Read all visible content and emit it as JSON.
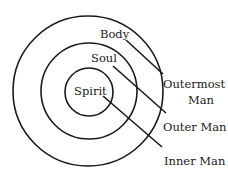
{
  "diagram": {
    "type": "concentric-circles",
    "colors": {
      "stroke": "#1a1a1a",
      "background": "#ffffff"
    },
    "rings": [
      {
        "name": "outer",
        "label": "Body"
      },
      {
        "name": "middle",
        "label": "Soul"
      },
      {
        "name": "inner",
        "label": "Spirit"
      }
    ],
    "callouts": [
      {
        "line1": "Outermost",
        "line2": "Man"
      },
      {
        "line1": "Outer Man"
      },
      {
        "line1": "Inner Man"
      }
    ]
  }
}
